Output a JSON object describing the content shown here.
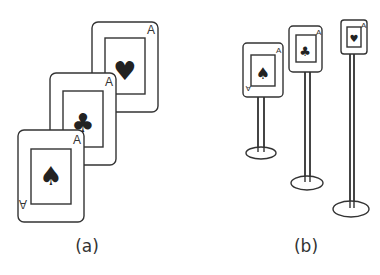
{
  "figure": {
    "panel_a": {
      "label": "(a)",
      "description": "Three overlapping playing cards, staggered diagonally",
      "cards": [
        {
          "rank": "A",
          "suit": "heart",
          "glyph": "♥"
        },
        {
          "rank": "A",
          "suit": "club",
          "glyph": "♣"
        },
        {
          "rank": "A",
          "suit": "spade",
          "glyph": "♠"
        }
      ]
    },
    "panel_b": {
      "label": "(b)",
      "description": "Three cards mounted on poles at increasing distances",
      "cards": [
        {
          "rank": "A",
          "suit": "spade",
          "glyph": "♠"
        },
        {
          "rank": "A",
          "suit": "club",
          "glyph": "♣"
        },
        {
          "rank": "A",
          "suit": "heart",
          "glyph": "♥"
        }
      ]
    },
    "colors": {
      "stroke": "#333333",
      "fill": "#222222",
      "background": "#ffffff"
    }
  }
}
